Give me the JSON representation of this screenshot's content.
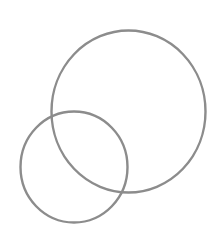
{
  "canvas": {
    "width": 220,
    "height": 246,
    "background": "#ffffff"
  },
  "shapes": [
    {
      "name": "large-circle",
      "type": "ellipse",
      "cx": 128.5,
      "cy": 111.5,
      "rx": 77,
      "ry": 81,
      "stroke": "#8c8c8c",
      "stroke_width": 2.4
    },
    {
      "name": "small-circle",
      "type": "ellipse",
      "cx": 74,
      "cy": 167,
      "rx": 53.5,
      "ry": 55.5,
      "stroke": "#8c8c8c",
      "stroke_width": 2.4
    }
  ]
}
